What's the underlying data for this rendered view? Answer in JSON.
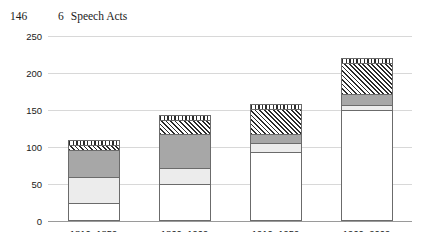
{
  "page": {
    "folio": "146",
    "chapter_number": "6",
    "running_head": "Speech Acts"
  },
  "chart_data": {
    "type": "bar",
    "stacked": true,
    "title": "",
    "subtitle": "",
    "xlabel": "",
    "ylabel": "",
    "grid": true,
    "legend": "none",
    "ylim": [
      0,
      250
    ],
    "yticks": [
      0,
      50,
      100,
      150,
      200,
      250
    ],
    "ytick_labels": [
      "0",
      "50",
      "100",
      "150",
      "200",
      "250"
    ],
    "categories": [
      "1810–1859",
      "1860–1909",
      "1910–1959",
      "1960–2009"
    ],
    "series": [
      {
        "name": "series-1",
        "fill": "white",
        "values": [
          25,
          50,
          93,
          150
        ]
      },
      {
        "name": "series-2",
        "fill": "light-gray",
        "values": [
          35,
          22,
          12,
          7
        ]
      },
      {
        "name": "series-3",
        "fill": "medium-gray",
        "values": [
          36,
          46,
          13,
          15
        ]
      },
      {
        "name": "series-4",
        "fill": "diagonal-hatch",
        "values": [
          7,
          18,
          34,
          42
        ]
      },
      {
        "name": "series-5",
        "fill": "vertical-stripe",
        "values": [
          7,
          7,
          6,
          6
        ]
      }
    ],
    "totals": [
      110,
      143,
      158,
      220
    ]
  },
  "colors": {
    "series_1": "#ffffff",
    "series_2": "#ececec",
    "series_3": "#a7a7a7",
    "series_4_ink": "#2b2b2b",
    "series_5_ink": "#2b2b2b",
    "gridline": "#d8d8d8",
    "axis": "#9a9a9a",
    "bar_outline": "#6b6b6b",
    "text": "#1a1a1a"
  }
}
